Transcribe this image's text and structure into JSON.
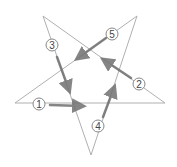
{
  "diagram": {
    "star_points": {
      "top_left": [
        43,
        16
      ],
      "top_right": [
        137,
        16
      ],
      "right": [
        165,
        103
      ],
      "bottom": [
        91,
        155
      ],
      "left": [
        15,
        103
      ]
    },
    "lines": [
      [
        "top_left",
        "bottom"
      ],
      [
        "bottom",
        "top_right"
      ],
      [
        "top_right",
        "left"
      ],
      [
        "left",
        "right"
      ],
      [
        "right",
        "top_left"
      ]
    ],
    "line_color": "#b0b0b0",
    "arrow_color": "#707070",
    "strokes": [
      {
        "label": "1",
        "circle": [
          39,
          104
        ],
        "from": [
          50,
          105
        ],
        "to": [
          82,
          106
        ]
      },
      {
        "label": "2",
        "circle": [
          139,
          84
        ],
        "from": [
          131,
          78
        ],
        "to": [
          104,
          60
        ]
      },
      {
        "label": "3",
        "circle": [
          52,
          45
        ],
        "from": [
          57,
          57
        ],
        "to": [
          69,
          90
        ]
      },
      {
        "label": "4",
        "circle": [
          98,
          126
        ],
        "from": [
          103,
          117
        ],
        "to": [
          114,
          88
        ]
      },
      {
        "label": "5",
        "circle": [
          112,
          34
        ],
        "from": [
          106,
          38
        ],
        "to": [
          78,
          58
        ]
      }
    ]
  }
}
